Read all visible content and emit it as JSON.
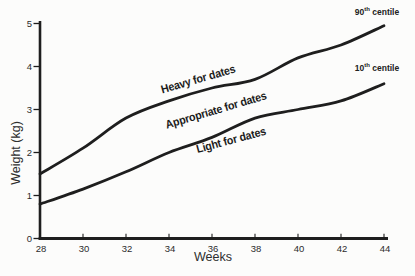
{
  "chart_data": {
    "type": "line",
    "title": "",
    "xlabel": "Weeks",
    "ylabel": "Weight (kg)",
    "xlim": [
      28,
      44
    ],
    "ylim": [
      0,
      5
    ],
    "x_ticks": [
      "28",
      "30",
      "32",
      "34",
      "36",
      "38",
      "40",
      "42",
      "44"
    ],
    "y_ticks": [
      "0",
      "1",
      "2",
      "3",
      "4",
      "5"
    ],
    "grid": false,
    "legend": "inline-end-labels",
    "line_color": "#1e1e1e",
    "x": [
      28,
      30,
      32,
      34,
      36,
      38,
      40,
      42,
      44
    ],
    "series": [
      {
        "name": "90th centile",
        "label_parts": {
          "num": "90",
          "sup": "th",
          "rest": "centile"
        },
        "values": [
          1.5,
          2.1,
          2.8,
          3.2,
          3.5,
          3.7,
          4.2,
          4.5,
          4.95
        ]
      },
      {
        "name": "10th centile",
        "label_parts": {
          "num": "10",
          "sup": "th",
          "rest": "centile"
        },
        "values": [
          0.8,
          1.15,
          1.55,
          2.0,
          2.35,
          2.8,
          3.0,
          3.2,
          3.6
        ]
      }
    ],
    "annotations": [
      {
        "text": "Heavy for dates",
        "position": "above 90th centile line"
      },
      {
        "text": "Appropriate for dates",
        "position": "between centile lines"
      },
      {
        "text": "Light for dates",
        "position": "below 10th centile line"
      }
    ]
  }
}
